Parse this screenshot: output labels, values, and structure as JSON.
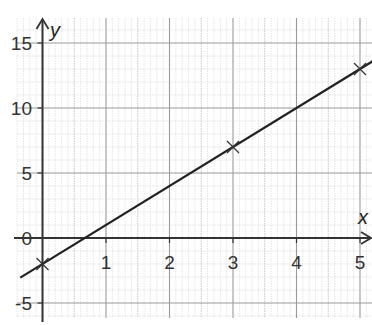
{
  "chart_data": {
    "type": "line",
    "title": "",
    "xlabel": "x",
    "ylabel": "y",
    "xlim": [
      -0.4,
      5.2
    ],
    "ylim": [
      -6,
      17
    ],
    "x_ticks": [
      1,
      2,
      3,
      4,
      5
    ],
    "y_ticks": [
      -5,
      0,
      5,
      10,
      15
    ],
    "grid": true,
    "series": [
      {
        "name": "line",
        "equation": "y = 3x - 2",
        "x": [
          -0.35,
          5.2
        ],
        "y": [
          -3.05,
          13.6
        ]
      }
    ],
    "points": [
      {
        "x": 0,
        "y": -2,
        "marker": "x"
      },
      {
        "x": 3,
        "y": 7,
        "marker": "x"
      },
      {
        "x": 5,
        "y": 13,
        "marker": "x"
      }
    ],
    "colors": {
      "line": "#222222",
      "axis": "#333333",
      "grid_major": "#9a9a9a",
      "grid_minor": "#d4d4d4"
    }
  }
}
